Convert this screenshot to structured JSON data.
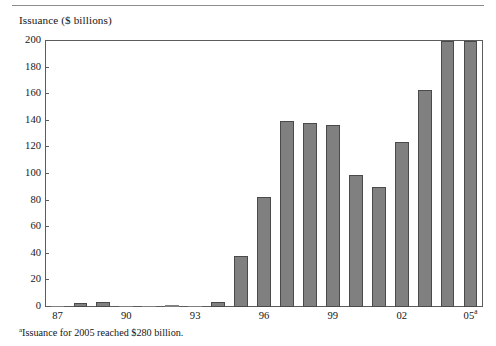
{
  "figure": {
    "axis_title": "Issuance ($ billions)",
    "footnote_marker": "a",
    "footnote_text": "Issuance for 2005 reached $280 billion.",
    "bar_color": "#808080",
    "bar_edge_color": "#4a4a4a",
    "frame_color": "#5c5c5c",
    "rule_color": "#8d8d8d",
    "text_color": "#161616"
  },
  "chart_data": {
    "type": "bar",
    "title": "Issuance ($ billions)",
    "xlabel": "",
    "ylabel": "Issuance ($ billions)",
    "ylim": [
      0,
      200
    ],
    "yticks": [
      0,
      20,
      40,
      60,
      80,
      100,
      120,
      140,
      160,
      180,
      200
    ],
    "ytick_labels": [
      "0",
      "20",
      "40",
      "60",
      "80",
      "100",
      "120",
      "140",
      "160",
      "180",
      "200"
    ],
    "grid": false,
    "legend": "none",
    "categories": [
      "87",
      "88",
      "89",
      "90",
      "91",
      "92",
      "93",
      "94",
      "95",
      "96",
      "97",
      "98",
      "99",
      "00",
      "01",
      "02",
      "03",
      "04",
      "05"
    ],
    "xtick_labels": [
      "87",
      "90",
      "93",
      "96",
      "99",
      "02",
      "05"
    ],
    "xtick_label_suffix_last": "a",
    "xtick_indices": [
      0,
      3,
      6,
      9,
      12,
      15,
      18
    ],
    "values": [
      1,
      3,
      4,
      1,
      0.5,
      1.5,
      1,
      4,
      38,
      83,
      140,
      138,
      137,
      99,
      90,
      124,
      163,
      200,
      200
    ],
    "annotations": [
      "Issuance for 2005 reached $280 billion."
    ]
  }
}
